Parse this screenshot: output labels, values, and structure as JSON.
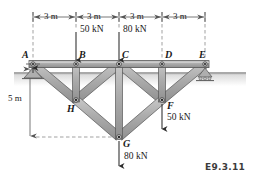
{
  "figure": {
    "id_label": "E9.3.11",
    "type": "truss-free-body-diagram",
    "background_color": "#ffffff",
    "member_fill": "#a8a8a8",
    "member_stroke": "#4a4a4a",
    "ground_color": "#b3b3b3",
    "dimension_color": "#555555",
    "arrow_color": "#2b2b2b"
  },
  "joints": [
    {
      "name": "A",
      "label": "A",
      "x": 33,
      "y": 64,
      "label_dx": -11,
      "label_dy": -13
    },
    {
      "name": "B",
      "label": "B",
      "x": 76,
      "y": 64,
      "label_dx": 4,
      "label_dy": -13
    },
    {
      "name": "C",
      "label": "C",
      "x": 119,
      "y": 64,
      "label_dx": 4,
      "label_dy": -13
    },
    {
      "name": "D",
      "label": "D",
      "x": 162,
      "y": 64,
      "label_dx": 4,
      "label_dy": -13
    },
    {
      "name": "E",
      "label": "E",
      "x": 205,
      "y": 64,
      "label_dx": 2,
      "label_dy": -13
    },
    {
      "name": "H",
      "label": "H",
      "x": 76,
      "y": 100,
      "label_dx": -4,
      "label_dy": 5
    },
    {
      "name": "F",
      "label": "F",
      "x": 162,
      "y": 100,
      "label_dx": 4,
      "label_dy": 3
    },
    {
      "name": "G",
      "label": "G",
      "x": 119,
      "y": 137,
      "label_dx": 4,
      "label_dy": 2
    }
  ],
  "members": [
    {
      "name": "member-A-B",
      "from": "A",
      "to": "B"
    },
    {
      "name": "member-B-C",
      "from": "B",
      "to": "C"
    },
    {
      "name": "member-C-D",
      "from": "C",
      "to": "D"
    },
    {
      "name": "member-D-E",
      "from": "D",
      "to": "E"
    },
    {
      "name": "member-A-H",
      "from": "A",
      "to": "H"
    },
    {
      "name": "member-B-H",
      "from": "B",
      "to": "H"
    },
    {
      "name": "member-H-C",
      "from": "H",
      "to": "C"
    },
    {
      "name": "member-H-G",
      "from": "H",
      "to": "G"
    },
    {
      "name": "member-C-G",
      "from": "C",
      "to": "G"
    },
    {
      "name": "member-G-F",
      "from": "G",
      "to": "F"
    },
    {
      "name": "member-C-F",
      "from": "C",
      "to": "F"
    },
    {
      "name": "member-D-F",
      "from": "D",
      "to": "F"
    },
    {
      "name": "member-F-E",
      "from": "F",
      "to": "E"
    }
  ],
  "loads": [
    {
      "name": "load-at-B",
      "magnitude": "50 kN",
      "at_joint": "B",
      "direction": "down",
      "arrow_x": 76,
      "arrow_y_start": 32,
      "arrow_y_end": 62,
      "label_x": 80,
      "label_y": 28
    },
    {
      "name": "load-at-C",
      "magnitude": "80 kN",
      "at_joint": "C",
      "direction": "down",
      "arrow_x": 119,
      "arrow_y_start": 32,
      "arrow_y_end": 62,
      "label_x": 123,
      "label_y": 28
    },
    {
      "name": "load-at-F",
      "magnitude": "50 kN",
      "at_joint": "F",
      "direction": "down",
      "arrow_x": 162,
      "arrow_y_start": 102,
      "arrow_y_end": 131,
      "label_x": 167,
      "label_y": 118
    },
    {
      "name": "load-at-G",
      "magnitude": "80 kN",
      "at_joint": "G",
      "direction": "down",
      "arrow_x": 119,
      "arrow_y_start": 140,
      "arrow_y_end": 168,
      "label_x": 124,
      "label_y": 157
    }
  ],
  "dimensions": {
    "horizontal": [
      {
        "name": "dim-A-B",
        "text": "3 m",
        "x_start": 33,
        "x_end": 76,
        "y": 17
      },
      {
        "name": "dim-B-C",
        "text": "3 m",
        "x_start": 76,
        "x_end": 119,
        "y": 17
      },
      {
        "name": "dim-C-D",
        "text": "3 m",
        "x_start": 119,
        "x_end": 162,
        "y": 17
      },
      {
        "name": "dim-D-E",
        "text": "3 m",
        "x_start": 162,
        "x_end": 205,
        "y": 17
      }
    ],
    "vertical": [
      {
        "name": "dim-height",
        "text": "5 m",
        "x": 30,
        "y_start": 68,
        "y_end": 137,
        "label_x": 8,
        "label_y": 98
      }
    ]
  },
  "supports": [
    {
      "name": "pin-support-A",
      "at_joint": "A",
      "type": "pin"
    },
    {
      "name": "roller-support-E",
      "at_joint": "E",
      "type": "roller"
    }
  ],
  "ground": {
    "name": "ground-hatch",
    "left_x": 33,
    "left_y": 72,
    "right_x": 205,
    "right_y": 72
  }
}
